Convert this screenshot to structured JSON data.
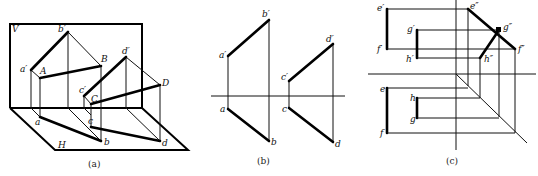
{
  "figure": {
    "panels": [
      {
        "id": "a",
        "caption": "(a)",
        "type": "pictorial projection",
        "planes": {
          "vertical": "V",
          "horizontal": "H"
        },
        "labels": {
          "a_prime": "a′",
          "b_prime": "b′",
          "A": "A",
          "B": "B",
          "a": "a",
          "b": "b",
          "c_prime": "c′",
          "d_prime": "d′",
          "C": "C",
          "D": "D",
          "c": "c",
          "d": "d"
        }
      },
      {
        "id": "b",
        "caption": "(b)",
        "type": "two-view projection",
        "labels": {
          "a_prime": "a′",
          "b_prime": "b′",
          "a": "a",
          "b": "b",
          "c_prime": "c′",
          "d_prime": "d′",
          "c": "c",
          "d": "d"
        }
      },
      {
        "id": "c",
        "caption": "(c)",
        "type": "three-view projection",
        "labels": {
          "e_prime": "e′",
          "f_prime": "f′",
          "g_prime": "g′",
          "h_prime": "h′",
          "e_dprime": "e″",
          "f_dprime": "f″",
          "g_dprime": "g″",
          "h_dprime": "h″",
          "e": "e",
          "f": "f",
          "g": "g",
          "h": "h"
        }
      }
    ]
  }
}
